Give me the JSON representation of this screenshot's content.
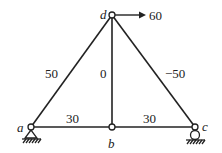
{
  "diagram": {
    "type": "truss",
    "nodes": [
      {
        "id": "a",
        "label": "a",
        "x": 31,
        "y": 127,
        "support": "pin"
      },
      {
        "id": "b",
        "label": "b",
        "x": 112,
        "y": 127,
        "support": "none"
      },
      {
        "id": "c",
        "label": "c",
        "x": 195,
        "y": 127,
        "support": "roller"
      },
      {
        "id": "d",
        "label": "d",
        "x": 112,
        "y": 15,
        "support": "none"
      }
    ],
    "members": [
      {
        "from": "a",
        "to": "d",
        "force_label": "50"
      },
      {
        "from": "b",
        "to": "d",
        "force_label": "0"
      },
      {
        "from": "c",
        "to": "d",
        "force_label": "−50"
      },
      {
        "from": "a",
        "to": "b",
        "force_label": "30"
      },
      {
        "from": "b",
        "to": "c",
        "force_label": "30"
      }
    ],
    "loads": [
      {
        "node": "d",
        "direction": "right",
        "label": "60"
      }
    ],
    "colors": {
      "line": "#222222",
      "background": "#ffffff"
    }
  }
}
